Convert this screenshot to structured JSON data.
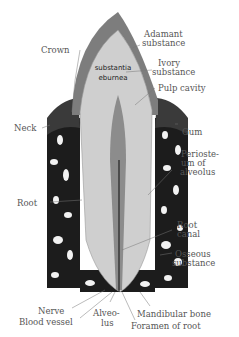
{
  "diagram": {
    "labels": {
      "crown": "Crown",
      "adamant_1": "Adamant",
      "adamant_2": "substance",
      "ivory_1": "Ivory",
      "ivory_2": "substance",
      "substantia_1": "substantia",
      "substantia_2": "eburnea",
      "pulp_cavity": "Pulp cavity",
      "neck": "Neck",
      "gum": "Gum",
      "periosteum_1": "Perioste-",
      "periosteum_2": "um of",
      "periosteum_3": "alveolus",
      "root": "Root",
      "root_canal_1": "Root",
      "root_canal_2": "canal",
      "osseous_1": "Osseous",
      "osseous_2": "substance",
      "nerve": "Nerve",
      "blood_vessel": "Blood vessel",
      "alveolus_1": "Alveo-",
      "alveolus_2": "lus",
      "mandibular_bone": "Mandibular bone",
      "foramen": "Foramen of root"
    },
    "colors": {
      "bone": "#1a1a1a",
      "enamel": "#7a7a7a",
      "dentin": "#cfcfcf",
      "pulp": "#9a9a9a",
      "label": "#555555"
    }
  }
}
